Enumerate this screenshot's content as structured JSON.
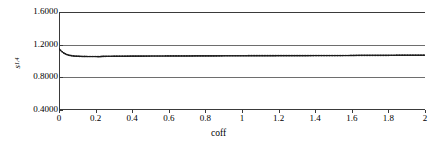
{
  "chart_data": {
    "type": "line",
    "title": "",
    "xlabel": "coff",
    "ylabel": "s",
    "ylabel_subscript": "1,4",
    "xlim": [
      0,
      2
    ],
    "ylim": [
      0.4,
      1.6
    ],
    "grid": true,
    "grid_lines_y": [
      0.8,
      1.2
    ],
    "legend": "none",
    "marker": "dot",
    "line_color": "#1a1a1a",
    "axis_color": "#3a3a3a",
    "grid_color": "#6e6e6e",
    "xticks": [
      0,
      0.2,
      0.4,
      0.6,
      0.8,
      1,
      1.2,
      1.4,
      1.6,
      1.8,
      2
    ],
    "xticklabels": [
      "0",
      "0.2",
      "0.4",
      "0.6",
      "0.8",
      "1",
      "1.2",
      "1.4",
      "1.6",
      "1.8",
      "2"
    ],
    "yticks": [
      0.4,
      0.8,
      1.2,
      1.6
    ],
    "yticklabels": [
      "0.4000",
      "0.8000",
      "1.2000",
      "1.6000"
    ],
    "x": [
      0.0,
      0.01,
      0.02,
      0.03,
      0.04,
      0.05,
      0.06,
      0.07,
      0.08,
      0.09,
      0.1,
      0.12,
      0.14,
      0.16,
      0.18,
      0.2,
      0.22,
      0.24,
      0.26,
      0.28,
      0.3,
      0.35,
      0.4,
      0.45,
      0.5,
      0.55,
      0.6,
      0.65,
      0.7,
      0.75,
      0.8,
      0.85,
      0.9,
      0.95,
      1.0,
      1.05,
      1.1,
      1.15,
      1.2,
      1.25,
      1.3,
      1.35,
      1.4,
      1.45,
      1.5,
      1.55,
      1.6,
      1.65,
      1.7,
      1.75,
      1.8,
      1.85,
      1.9,
      1.95,
      2.0
    ],
    "y": [
      1.152,
      1.128,
      1.108,
      1.093,
      1.082,
      1.074,
      1.069,
      1.065,
      1.062,
      1.06,
      1.059,
      1.057,
      1.056,
      1.055,
      1.055,
      1.055,
      1.054,
      1.057,
      1.058,
      1.058,
      1.059,
      1.059,
      1.06,
      1.06,
      1.061,
      1.061,
      1.062,
      1.062,
      1.062,
      1.063,
      1.063,
      1.063,
      1.064,
      1.064,
      1.064,
      1.065,
      1.065,
      1.065,
      1.066,
      1.066,
      1.066,
      1.066,
      1.067,
      1.067,
      1.067,
      1.067,
      1.068,
      1.07,
      1.07,
      1.07,
      1.07,
      1.071,
      1.071,
      1.071,
      1.071
    ]
  }
}
